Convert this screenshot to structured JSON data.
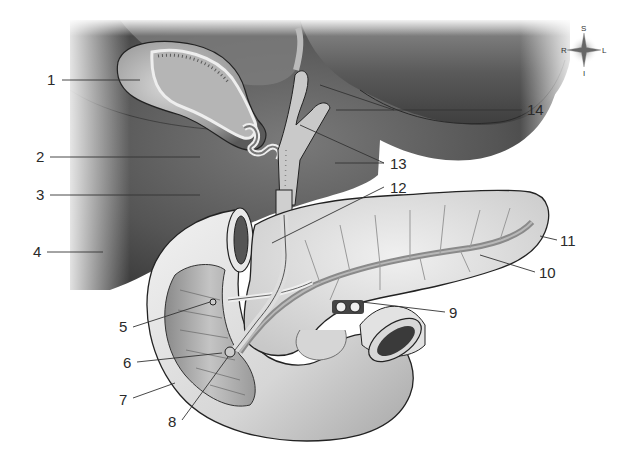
{
  "figure": {
    "colors": {
      "background": "#ffffff",
      "liver_dark": "#4a4a4a",
      "liver_mid": "#6b6b6b",
      "organ_light": "#d9d9d9",
      "organ_mid": "#a8a8a8",
      "outline": "#222222",
      "label_text": "#2a2a2a"
    }
  },
  "compass": {
    "top": "S",
    "bottom": "I",
    "left": "R",
    "right": "L"
  },
  "labels": [
    {
      "id": "1",
      "text": "1",
      "x": 47,
      "y": 68
    },
    {
      "id": "2",
      "text": "2",
      "x": 35,
      "y": 150
    },
    {
      "id": "3",
      "text": "3",
      "x": 35,
      "y": 188
    },
    {
      "id": "4",
      "text": "4",
      "x": 32,
      "y": 244
    },
    {
      "id": "5",
      "text": "5",
      "x": 118,
      "y": 318
    },
    {
      "id": "6",
      "text": "6",
      "x": 122,
      "y": 354
    },
    {
      "id": "7",
      "text": "7",
      "x": 118,
      "y": 391
    },
    {
      "id": "8",
      "text": "8",
      "x": 168,
      "y": 413
    },
    {
      "id": "9",
      "text": "9",
      "x": 449,
      "y": 305
    },
    {
      "id": "10",
      "text": "10",
      "x": 539,
      "y": 265
    },
    {
      "id": "11",
      "text": "11",
      "x": 559,
      "y": 233
    },
    {
      "id": "12",
      "text": "12",
      "x": 390,
      "y": 180
    },
    {
      "id": "13",
      "text": "13",
      "x": 389,
      "y": 156
    },
    {
      "id": "14",
      "text": "14",
      "x": 527,
      "y": 102
    }
  ]
}
